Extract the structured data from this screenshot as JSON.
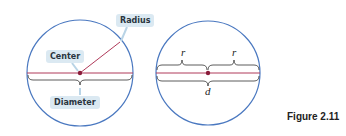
{
  "left_diagram": {
    "labels": {
      "radius": "Radius",
      "center": "Center",
      "diameter": "Diameter"
    }
  },
  "right_diagram": {
    "labels": {
      "r_left": "r",
      "r_right": "r",
      "d": "d"
    }
  },
  "caption": "Figure 2.11",
  "colors": {
    "circle": "#4a78c0",
    "line": "#b03a5a",
    "center_dot": "#8a1c3a",
    "label_bg": "#dbe9f2"
  }
}
